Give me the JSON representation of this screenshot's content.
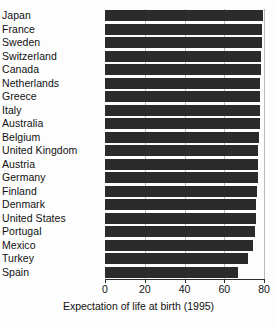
{
  "chart_data": {
    "type": "bar",
    "orientation": "horizontal",
    "title": "",
    "xlabel": "Expectation of life at birth (1995)",
    "ylabel": "",
    "xlim": [
      0,
      80
    ],
    "xticks": [
      0,
      20,
      40,
      60,
      80
    ],
    "xticklabels": [
      "0",
      "20",
      "40",
      "60",
      "80"
    ],
    "grid": true,
    "grid_axis": "x",
    "legend": false,
    "bar_color": "#2b2b2b",
    "categories": [
      "Japan",
      "France",
      "Sweden",
      "Switzerland",
      "Canada",
      "Netherlands",
      "Greece",
      "Italy",
      "Australia",
      "Belgium",
      "United Kingdom",
      "Austria",
      "Germany",
      "Finland",
      "Denmark",
      "United States",
      "Portugal",
      "Mexico",
      "Turkey",
      "Spain"
    ],
    "values": [
      79.5,
      79.0,
      78.8,
      78.6,
      78.4,
      78.2,
      78.0,
      78.0,
      77.8,
      77.5,
      77.2,
      77.0,
      76.8,
      76.5,
      76.2,
      76.0,
      75.5,
      74.5,
      72.0,
      67.0
    ]
  },
  "axis": {
    "x_label": "Expectation of life at birth (1995)"
  }
}
